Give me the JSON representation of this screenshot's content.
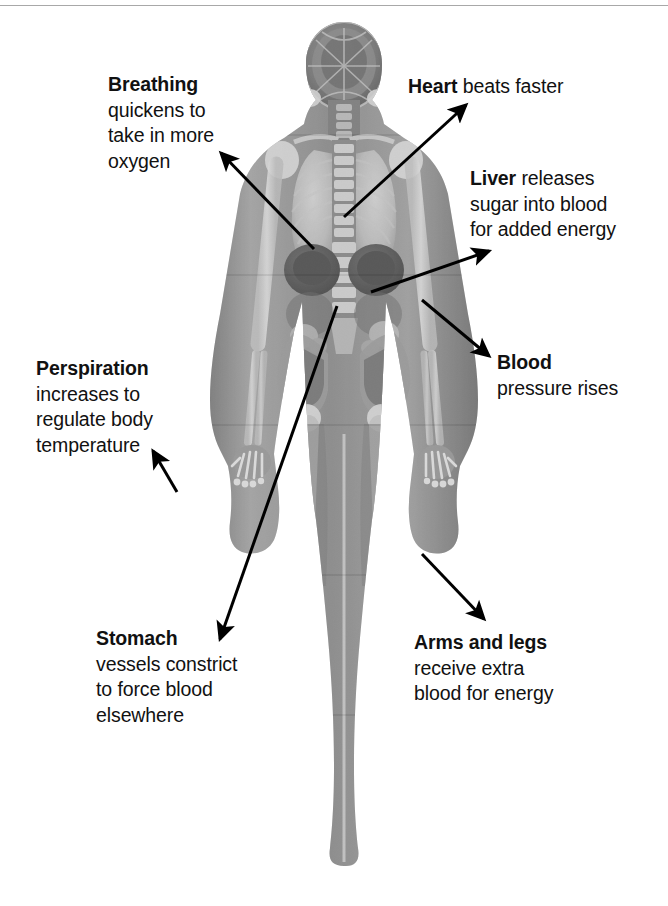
{
  "figure": {
    "background_color": "#ffffff",
    "text_color": "#111111",
    "arrow_color": "#000000",
    "rule_color": "#a8a8a8"
  },
  "callouts": [
    {
      "id": "breathing",
      "lead": "Breathing",
      "lines": [
        "quickens to",
        "take in more",
        "oxygen"
      ],
      "position": {
        "left": 108,
        "top": 72
      }
    },
    {
      "id": "heart",
      "lead": "Heart",
      "inline": " beats faster",
      "lines": [],
      "position": {
        "left": 408,
        "top": 74
      }
    },
    {
      "id": "liver",
      "lead": "Liver",
      "inline": " releases",
      "lines": [
        "sugar into blood",
        "for added energy"
      ],
      "position": {
        "left": 470,
        "top": 166
      }
    },
    {
      "id": "blood",
      "lead": "Blood",
      "lines": [
        "pressure rises"
      ],
      "position": {
        "left": 497,
        "top": 350
      }
    },
    {
      "id": "perspiration",
      "lead": "Perspiration",
      "lines": [
        "increases to",
        "regulate body",
        "temperature"
      ],
      "position": {
        "left": 36,
        "top": 356
      }
    },
    {
      "id": "stomach",
      "lead": "Stomach",
      "lines": [
        "vessels constrict",
        "to force blood",
        "elsewhere"
      ],
      "position": {
        "left": 96,
        "top": 626
      }
    },
    {
      "id": "arms-and-legs",
      "lead": "Arms and legs",
      "lines": [
        "receive extra",
        "blood for energy"
      ],
      "position": {
        "left": 414,
        "top": 630
      }
    }
  ],
  "arrows": [
    {
      "id": "breathing-arrow",
      "from": [
        314,
        249
      ],
      "to": [
        221,
        153
      ]
    },
    {
      "id": "heart-arrow",
      "from": [
        344,
        217
      ],
      "to": [
        466,
        105
      ]
    },
    {
      "id": "liver-arrow",
      "from": [
        371,
        292
      ],
      "to": [
        489,
        251
      ]
    },
    {
      "id": "blood-arrow",
      "from": [
        422,
        300
      ],
      "to": [
        489,
        356
      ]
    },
    {
      "id": "perspiration-arrow",
      "from": [
        177,
        492
      ],
      "to": [
        153,
        451
      ]
    },
    {
      "id": "stomach-arrow",
      "from": [
        337,
        306
      ],
      "to": [
        220,
        639
      ]
    },
    {
      "id": "arms-and-legs-arrow",
      "from": [
        422,
        554
      ],
      "to": [
        484,
        619
      ]
    }
  ]
}
